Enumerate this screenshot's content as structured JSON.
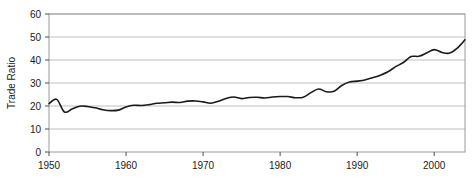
{
  "chart_data": {
    "type": "line",
    "title": "",
    "xlabel": "",
    "ylabel": "Trade Ratio",
    "xlim": [
      1950,
      2004
    ],
    "ylim": [
      0,
      60
    ],
    "xticks": [
      1950,
      1960,
      1970,
      1980,
      1990,
      2000
    ],
    "yticks": [
      0,
      10,
      20,
      30,
      40,
      50,
      60
    ],
    "grid": true,
    "grid_axis": "y",
    "legend": false,
    "legend_position": "none",
    "line_color": "#1a1a1a",
    "grid_color": "#bfbfbf",
    "frame_color": "#808080",
    "background_color": "#ffffff",
    "x": [
      1950,
      1951,
      1952,
      1953,
      1954,
      1955,
      1956,
      1957,
      1958,
      1959,
      1960,
      1961,
      1962,
      1963,
      1964,
      1965,
      1966,
      1967,
      1968,
      1969,
      1970,
      1971,
      1972,
      1973,
      1974,
      1975,
      1976,
      1977,
      1978,
      1979,
      1980,
      1981,
      1982,
      1983,
      1984,
      1985,
      1986,
      1987,
      1988,
      1989,
      1990,
      1991,
      1992,
      1993,
      1994,
      1995,
      1996,
      1997,
      1998,
      1999,
      2000,
      2001,
      2002,
      2003,
      2004
    ],
    "values": [
      21.0,
      22.9,
      17.4,
      18.7,
      19.9,
      19.8,
      19.2,
      18.4,
      18.0,
      18.2,
      19.6,
      20.3,
      20.2,
      20.6,
      21.2,
      21.4,
      21.7,
      21.5,
      22.1,
      22.2,
      21.8,
      21.2,
      22.1,
      23.3,
      23.9,
      23.2,
      23.7,
      23.8,
      23.5,
      23.9,
      24.1,
      24.1,
      23.6,
      23.8,
      25.8,
      27.4,
      26.2,
      26.4,
      28.9,
      30.4,
      30.8,
      31.3,
      32.3,
      33.4,
      34.9,
      37.1,
      38.9,
      41.5,
      41.6,
      43.0,
      44.5,
      43.3,
      43.0,
      45.2,
      48.8
    ],
    "series_name": "Trade Ratio"
  },
  "axis": {
    "y_title": "Trade Ratio",
    "y_tick_labels": [
      "60",
      "50",
      "40",
      "30",
      "20",
      "10",
      "0"
    ],
    "x_tick_labels": [
      "1950",
      "1960",
      "1970",
      "1980",
      "1990",
      "2000"
    ]
  }
}
